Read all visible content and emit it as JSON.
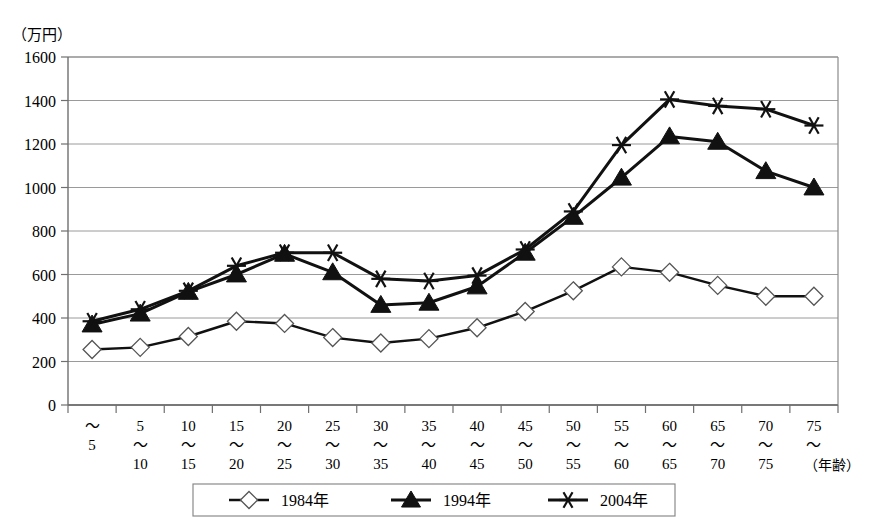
{
  "chart_data": {
    "type": "line",
    "title": "",
    "unit_label": "（万円）",
    "xlabel": "（年齢）",
    "ylabel": "",
    "ylim": [
      0,
      1600
    ],
    "ytick_step": 200,
    "yticks": [
      0,
      200,
      400,
      600,
      800,
      1000,
      1200,
      1400,
      1600
    ],
    "grid": true,
    "legend_position": "bottom-center",
    "categories": [
      "〜5",
      "5〜10",
      "10〜15",
      "15〜20",
      "20〜25",
      "25〜30",
      "30〜35",
      "35〜40",
      "40〜45",
      "45〜50",
      "50〜55",
      "55〜60",
      "60〜65",
      "65〜70",
      "70〜75",
      "75〜"
    ],
    "category_top": [
      "",
      "5",
      "10",
      "15",
      "20",
      "25",
      "30",
      "35",
      "40",
      "45",
      "50",
      "55",
      "60",
      "65",
      "70",
      "75"
    ],
    "category_sep": [
      "〜",
      "〜",
      "〜",
      "〜",
      "〜",
      "〜",
      "〜",
      "〜",
      "〜",
      "〜",
      "〜",
      "〜",
      "〜",
      "〜",
      "〜",
      "〜"
    ],
    "category_bottom": [
      "5",
      "10",
      "15",
      "20",
      "25",
      "30",
      "35",
      "40",
      "45",
      "50",
      "55",
      "60",
      "65",
      "70",
      "75",
      ""
    ],
    "series": [
      {
        "name": "1984年",
        "marker": "open-diamond",
        "values": [
          255,
          265,
          315,
          385,
          375,
          310,
          285,
          305,
          355,
          430,
          525,
          635,
          610,
          550,
          500,
          500
        ]
      },
      {
        "name": "1994年",
        "marker": "filled-triangle",
        "values": [
          370,
          420,
          520,
          600,
          695,
          610,
          460,
          470,
          545,
          700,
          865,
          1045,
          1235,
          1210,
          1075,
          1000
        ]
      },
      {
        "name": "2004年",
        "marker": "star",
        "values": [
          385,
          440,
          525,
          640,
          700,
          700,
          580,
          570,
          595,
          715,
          890,
          1195,
          1405,
          1375,
          1360,
          1285
        ]
      }
    ]
  },
  "legend": {
    "entries": [
      {
        "label": "1984年",
        "marker": "open-diamond"
      },
      {
        "label": "1994年",
        "marker": "filled-triangle"
      },
      {
        "label": "2004年",
        "marker": "star"
      }
    ]
  },
  "colors": {
    "line": "#111111",
    "grid": "#9a9a9a",
    "axis": "#6f6f6f",
    "marker_fill_open": "#ffffff",
    "marker_fill_solid": "#111111",
    "background": "#ffffff"
  }
}
